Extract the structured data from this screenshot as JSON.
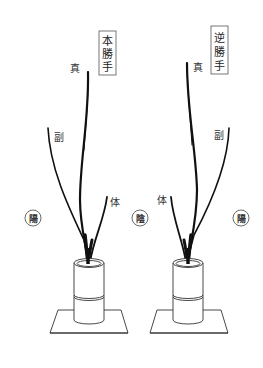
{
  "diagram": {
    "left": {
      "title": "本勝手",
      "title_chars": [
        "本",
        "勝",
        "手"
      ],
      "labels": {
        "shin": "真",
        "soe": "副",
        "tai": "体"
      },
      "sides": {
        "left": "陽"
      }
    },
    "right": {
      "title": "逆勝手",
      "title_chars": [
        "逆",
        "勝",
        "手"
      ],
      "labels": {
        "shin": "真",
        "soe": "副",
        "tai": "体"
      },
      "sides": {
        "left": "陰",
        "right": "陽"
      }
    },
    "colors": {
      "stroke": "#111111",
      "text": "#333333",
      "background": "#ffffff"
    }
  }
}
